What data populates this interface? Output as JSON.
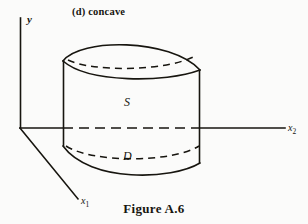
{
  "figure": {
    "panel_label": "(d) concave",
    "caption": "Figure A.6",
    "background_color": "#fbfbfa",
    "ink_color": "#17150f"
  },
  "axes": {
    "y": {
      "label": "y",
      "from": [
        20,
        128
      ],
      "to": [
        20,
        18
      ]
    },
    "x2": {
      "label": "x",
      "subscript": "2",
      "from": [
        20,
        128
      ],
      "to": [
        285,
        128
      ]
    },
    "x1": {
      "label": "x",
      "subscript": "1",
      "from": [
        20,
        128
      ],
      "to": [
        78,
        200
      ]
    }
  },
  "solid": {
    "surface_label": "S",
    "domain_label": "D",
    "left_edge_x": 63,
    "right_edge_x": 200,
    "top_cap_y": 45,
    "base_y": 160,
    "description": "convex solid over region D with upper surface S"
  }
}
